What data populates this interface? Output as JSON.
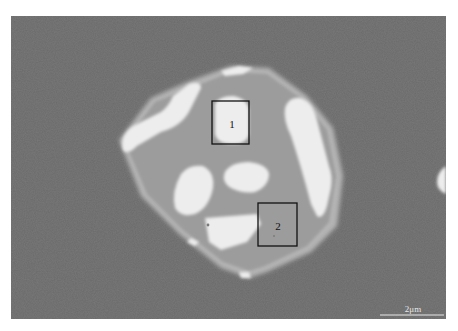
{
  "figure": {
    "type": "SEM micrograph (backscattered electron image)",
    "scale_bar": {
      "label": "2μm",
      "length_um": 2
    },
    "regions": [
      {
        "id": "region-1",
        "label": "1",
        "phase": "bright phase"
      },
      {
        "id": "region-2",
        "label": "2",
        "phase": "gray matrix phase"
      }
    ],
    "colors": {
      "background": "#6a6a6a",
      "particle_rim": "#b4b4b4",
      "particle_matrix": "#9c9c9c",
      "bright_phase": "#ededed",
      "box_stroke": "#111111"
    }
  }
}
